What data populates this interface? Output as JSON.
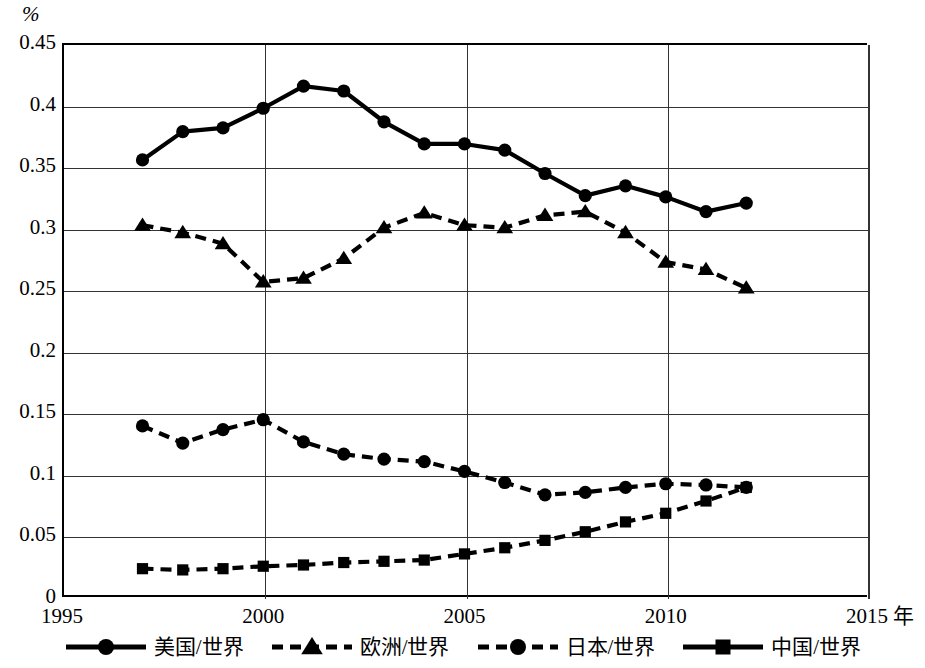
{
  "chart_data": {
    "type": "line",
    "title": "",
    "xlabel": "年",
    "ylabel": "%",
    "xlim": [
      1995,
      2015
    ],
    "ylim": [
      0,
      0.45
    ],
    "grid": true,
    "legend_position": "bottom",
    "x_ticks": [
      "1995",
      "2000",
      "2005",
      "2010",
      "2015"
    ],
    "x_tick_values": [
      1995,
      2000,
      2005,
      2010,
      2015
    ],
    "y_ticks": [
      "0",
      "0.05",
      "0.1",
      "0.15",
      "0.2",
      "0.25",
      "0.3",
      "0.35",
      "0.4",
      "0.45"
    ],
    "y_tick_values": [
      0,
      0.05,
      0.1,
      0.15,
      0.2,
      0.25,
      0.3,
      0.35,
      0.4,
      0.45
    ],
    "x": [
      1997,
      1998,
      1999,
      2000,
      2001,
      2002,
      2003,
      2004,
      2005,
      2006,
      2007,
      2008,
      2009,
      2010,
      2011,
      2012
    ],
    "series": [
      {
        "name": "美国/世界",
        "marker": "circle",
        "line_style": "solid",
        "color": "#000000",
        "values": [
          0.355,
          0.378,
          0.381,
          0.397,
          0.415,
          0.411,
          0.386,
          0.368,
          0.368,
          0.363,
          0.344,
          0.326,
          0.334,
          0.325,
          0.313,
          0.32
        ]
      },
      {
        "name": "欧洲/世界",
        "marker": "triangle",
        "line_style": "dashed",
        "color": "#000000",
        "values": [
          0.302,
          0.296,
          0.287,
          0.256,
          0.259,
          0.275,
          0.3,
          0.312,
          0.302,
          0.3,
          0.31,
          0.313,
          0.296,
          0.272,
          0.266,
          0.251
        ]
      },
      {
        "name": "日本/世界",
        "marker": "circle",
        "line_style": "dashed",
        "color": "#000000",
        "values": [
          0.139,
          0.125,
          0.136,
          0.144,
          0.126,
          0.116,
          0.112,
          0.11,
          0.102,
          0.093,
          0.083,
          0.085,
          0.089,
          0.092,
          0.091,
          0.089
        ]
      },
      {
        "name": "中国/世界",
        "marker": "square",
        "line_style": "dashed",
        "color": "#000000",
        "values": [
          0.023,
          0.022,
          0.023,
          0.025,
          0.026,
          0.028,
          0.029,
          0.03,
          0.035,
          0.04,
          0.046,
          0.053,
          0.061,
          0.068,
          0.078,
          0.089
        ]
      }
    ]
  },
  "axis": {
    "y_unit_label": "%",
    "x_unit_label": "年"
  },
  "legend": {
    "items": [
      {
        "label": "美国/世界",
        "marker": "circle",
        "line_style": "solid"
      },
      {
        "label": "欧洲/世界",
        "marker": "triangle",
        "line_style": "dashed"
      },
      {
        "label": "日本/世界",
        "marker": "circle",
        "line_style": "dashed"
      },
      {
        "label": "中国/世界",
        "marker": "square",
        "line_style": "solid"
      }
    ]
  }
}
